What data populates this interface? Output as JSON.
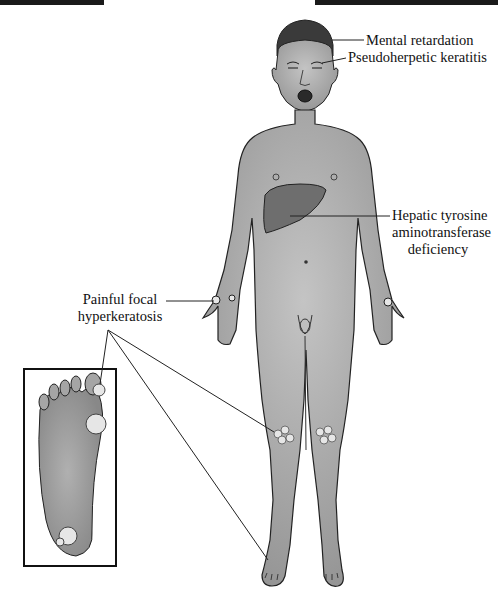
{
  "figure": {
    "type": "medical-illustration",
    "labels": {
      "mental": "Mental retardation",
      "keratitis": "Pseudoherpetic keratitis",
      "hepatic_line1": "Hepatic tyrosine",
      "hepatic_line2": "aminotransferase",
      "hepatic_line3": "deficiency",
      "hyper_line1": "Painful focal",
      "hyper_line2": "hyperkeratosis"
    },
    "inset": "plantar-foot-with-hyperkeratotic-lesions",
    "colors": {
      "skin": "#a9a9a9",
      "liver": "#6e6e6e",
      "hair": "#3a3a3a",
      "outline": "#222222",
      "lesion": "#e6e6e6"
    }
  }
}
